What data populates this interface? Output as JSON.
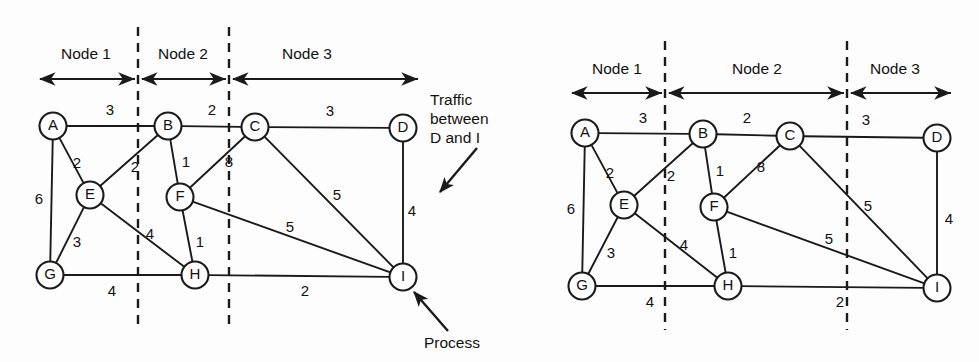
{
  "figure": {
    "background_color": "#fdfdfd",
    "ink_color": "#1a1a1a"
  },
  "chart_data": {
    "type": "diagram",
    "subtype": "weighted-undirected-graph",
    "panels": [
      {
        "id": "left",
        "name": "partition-a",
        "dividers_x": [
          138,
          229
        ],
        "bands": [
          {
            "label": "Node 1",
            "label_x": 86,
            "arrow_from": 40,
            "arrow_to": 135
          },
          {
            "label": "Node 2",
            "label_x": 183,
            "arrow_from": 142,
            "arrow_to": 226
          },
          {
            "label": "Node 3",
            "label_x": 307,
            "arrow_from": 233,
            "arrow_to": 418
          }
        ],
        "band_label_y": 55,
        "band_arrow_y": 79,
        "nodes": [
          {
            "id": "A",
            "x": 53,
            "y": 126
          },
          {
            "id": "B",
            "x": 168,
            "y": 126
          },
          {
            "id": "C",
            "x": 255,
            "y": 127
          },
          {
            "id": "D",
            "x": 403,
            "y": 128
          },
          {
            "id": "E",
            "x": 90,
            "y": 195
          },
          {
            "id": "F",
            "x": 180,
            "y": 197
          },
          {
            "id": "G",
            "x": 50,
            "y": 275
          },
          {
            "id": "H",
            "x": 195,
            "y": 275
          },
          {
            "id": "I",
            "x": 403,
            "y": 277
          }
        ],
        "edges": [
          {
            "from": "A",
            "to": "B",
            "weight": 3,
            "lx": 110,
            "ly": 111
          },
          {
            "from": "B",
            "to": "C",
            "weight": 2,
            "lx": 212,
            "ly": 111
          },
          {
            "from": "C",
            "to": "D",
            "weight": 3,
            "lx": 330,
            "ly": 112
          },
          {
            "from": "A",
            "to": "E",
            "weight": 2,
            "lx": 77,
            "ly": 164
          },
          {
            "from": "A",
            "to": "G",
            "weight": 6,
            "lx": 39,
            "ly": 200
          },
          {
            "from": "E",
            "to": "B",
            "weight": 2,
            "lx": 135,
            "ly": 168
          },
          {
            "from": "E",
            "to": "G",
            "weight": 3,
            "lx": 77,
            "ly": 243
          },
          {
            "from": "E",
            "to": "H",
            "weight": 4,
            "lx": 150,
            "ly": 235
          },
          {
            "from": "B",
            "to": "F",
            "weight": 1,
            "lx": 186,
            "ly": 163
          },
          {
            "from": "F",
            "to": "C",
            "weight": 8,
            "lx": 229,
            "ly": 163
          },
          {
            "from": "F",
            "to": "H",
            "weight": 1,
            "lx": 200,
            "ly": 243
          },
          {
            "from": "F",
            "to": "I",
            "weight": 5,
            "lx": 290,
            "ly": 228
          },
          {
            "from": "C",
            "to": "I",
            "weight": 5,
            "lx": 337,
            "ly": 196
          },
          {
            "from": "D",
            "to": "I",
            "weight": 4,
            "lx": 412,
            "ly": 212
          },
          {
            "from": "G",
            "to": "H",
            "weight": 4,
            "lx": 112,
            "ly": 292
          },
          {
            "from": "H",
            "to": "I",
            "weight": 2,
            "lx": 305,
            "ly": 292
          }
        ],
        "callouts": [
          {
            "name": "traffic-callout",
            "lines": [
              "Traffic",
              "between",
              "D and I"
            ],
            "text_x": 430,
            "text_y": 101,
            "line_height": 19,
            "arrow": {
              "x1": 477,
              "y1": 148,
              "x2": 440,
              "y2": 192
            }
          },
          {
            "name": "process-callout",
            "lines": [
              "Process"
            ],
            "text_x": 424,
            "text_y": 344,
            "line_height": 19,
            "arrow": {
              "x1": 448,
              "y1": 331,
              "x2": 414,
              "y2": 292
            }
          }
        ]
      },
      {
        "id": "right",
        "name": "partition-b",
        "dividers_x": [
          665,
          847
        ],
        "bands": [
          {
            "label": "Node 1",
            "label_x": 617,
            "arrow_from": 572,
            "arrow_to": 662
          },
          {
            "label": "Node 2",
            "label_x": 757,
            "arrow_from": 669,
            "arrow_to": 844
          },
          {
            "label": "Node 3",
            "label_x": 895,
            "arrow_from": 851,
            "arrow_to": 951
          }
        ],
        "band_label_y": 70,
        "band_arrow_y": 93,
        "nodes": [
          {
            "id": "A",
            "x": 585,
            "y": 133
          },
          {
            "id": "B",
            "x": 703,
            "y": 134
          },
          {
            "id": "C",
            "x": 790,
            "y": 136
          },
          {
            "id": "D",
            "x": 937,
            "y": 138
          },
          {
            "id": "E",
            "x": 624,
            "y": 205
          },
          {
            "id": "F",
            "x": 714,
            "y": 207
          },
          {
            "id": "G",
            "x": 582,
            "y": 286
          },
          {
            "id": "H",
            "x": 728,
            "y": 286
          },
          {
            "id": "I",
            "x": 937,
            "y": 288
          }
        ],
        "edges": [
          {
            "from": "A",
            "to": "B",
            "weight": 3,
            "lx": 643,
            "ly": 119
          },
          {
            "from": "B",
            "to": "C",
            "weight": 2,
            "lx": 747,
            "ly": 119
          },
          {
            "from": "C",
            "to": "D",
            "weight": 3,
            "lx": 866,
            "ly": 121
          },
          {
            "from": "A",
            "to": "E",
            "weight": 2,
            "lx": 610,
            "ly": 174
          },
          {
            "from": "A",
            "to": "G",
            "weight": 6,
            "lx": 571,
            "ly": 210
          },
          {
            "from": "E",
            "to": "B",
            "weight": 2,
            "lx": 671,
            "ly": 177
          },
          {
            "from": "E",
            "to": "G",
            "weight": 3,
            "lx": 611,
            "ly": 254
          },
          {
            "from": "E",
            "to": "H",
            "weight": 4,
            "lx": 684,
            "ly": 246
          },
          {
            "from": "B",
            "to": "F",
            "weight": 1,
            "lx": 720,
            "ly": 172
          },
          {
            "from": "F",
            "to": "C",
            "weight": 8,
            "lx": 761,
            "ly": 168
          },
          {
            "from": "F",
            "to": "H",
            "weight": 1,
            "lx": 733,
            "ly": 254
          },
          {
            "from": "F",
            "to": "I",
            "weight": 5,
            "lx": 829,
            "ly": 240
          },
          {
            "from": "C",
            "to": "I",
            "weight": 5,
            "lx": 868,
            "ly": 207
          },
          {
            "from": "D",
            "to": "I",
            "weight": 4,
            "lx": 949,
            "ly": 220
          },
          {
            "from": "G",
            "to": "H",
            "weight": 4,
            "lx": 650,
            "ly": 303
          },
          {
            "from": "H",
            "to": "I",
            "weight": 2,
            "lx": 840,
            "ly": 303
          }
        ],
        "callouts": []
      }
    ]
  }
}
